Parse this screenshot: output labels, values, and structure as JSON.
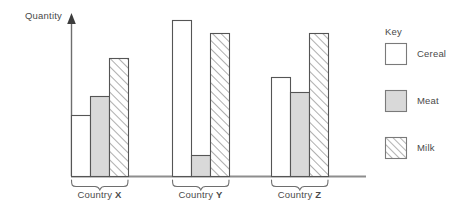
{
  "chart_data": {
    "type": "bar",
    "title": "",
    "subtitle": "",
    "xlabel": "",
    "ylabel": "Quantity",
    "grid": false,
    "legend_position": "right",
    "axis_style": "arrow-y-axis-only-no-ticks",
    "categories": [
      "Country X",
      "Country Y",
      "Country Z"
    ],
    "category_labels": [
      {
        "prefix": "Country ",
        "code": "X"
      },
      {
        "prefix": "Country ",
        "code": "Y"
      },
      {
        "prefix": "Country ",
        "code": "Z"
      }
    ],
    "ylim": [
      0,
      170
    ],
    "y_tick_labels": [],
    "series": [
      {
        "name": "Cereal",
        "fill": "#ffffff",
        "pattern": "solid",
        "stroke": "#555555",
        "values": [
          61,
          156,
          99
        ]
      },
      {
        "name": "Meat",
        "fill": "#d9d9d9",
        "pattern": "solid",
        "stroke": "#555555",
        "values": [
          80,
          21,
          84
        ]
      },
      {
        "name": "Milk",
        "fill": "#ffffff",
        "pattern": "diagonal-hatch",
        "stroke": "#555555",
        "values": [
          118,
          143,
          143
        ]
      }
    ],
    "legend": {
      "title": "Key",
      "entries": [
        {
          "label": "Cereal",
          "swatch": "white-solid"
        },
        {
          "label": "Meat",
          "swatch": "gray-solid"
        },
        {
          "label": "Milk",
          "swatch": "diagonal-hatch"
        }
      ]
    },
    "colors": {
      "cereal": "#ffffff",
      "meat": "#d9d9d9",
      "milk_hatch": "#8c8c8c",
      "outline": "#555555",
      "axis": "#6e6e6e",
      "text": "#4a4a4a",
      "background": "#ffffff"
    }
  }
}
